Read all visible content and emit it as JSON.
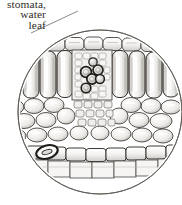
{
  "figure": {
    "kind": "botanical-line-illustration",
    "background_color": "#ffffff",
    "ink_color": "#2e2b28",
    "caption": {
      "align": "right",
      "clipped_at_left_edge": true,
      "lines": [
        "stomata,",
        "water",
        "leaf"
      ]
    },
    "leader_line": {
      "present": true,
      "description": "thin diagonal rule from caption toward circular inset"
    },
    "inset": {
      "shape": "circle",
      "center": [
        100,
        112
      ],
      "radius": 82,
      "outline_color": "#6f6a64"
    },
    "layers": [
      {
        "name": "upper epidermis",
        "cell_shape": "flattened rectangular",
        "row": "top"
      },
      {
        "name": "palisade mesophyll",
        "cell_shape": "tall columnar",
        "row": "upper-middle"
      },
      {
        "name": "vascular bundle",
        "cell_shape": "dark-ringed xylem cells",
        "row": "center"
      },
      {
        "name": "spongy mesophyll",
        "cell_shape": "small irregular",
        "row": "lower-middle"
      },
      {
        "name": "lower epidermis",
        "cell_shape": "flattened rectangular",
        "row": "bottom"
      },
      {
        "name": "stoma",
        "cell_shape": "dark oval guard cells",
        "row": "bottom-left"
      }
    ]
  }
}
